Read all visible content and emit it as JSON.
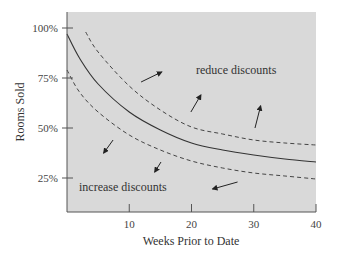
{
  "chart_data": {
    "type": "line",
    "title": "",
    "xlabel": "Weeks Prior to Date",
    "ylabel": "Rooms Sold",
    "xlim": [
      0,
      40
    ],
    "ylim": [
      8,
      108
    ],
    "grid": false,
    "legend": null,
    "x_ticks": [
      10,
      20,
      30,
      40
    ],
    "x_tick_labels": [
      "10",
      "20",
      "30",
      "40"
    ],
    "y_ticks": [
      25,
      50,
      75,
      100
    ],
    "y_tick_labels": [
      "25%",
      "50%",
      "75%",
      "100%"
    ],
    "series": [
      {
        "name": "expected booking curve",
        "style": "solid",
        "x": [
          0,
          2,
          5,
          10,
          15,
          20,
          25,
          30,
          35,
          40
        ],
        "values": [
          97,
          85,
          72,
          58,
          49,
          42.5,
          39,
          36.5,
          34.5,
          33
        ]
      },
      {
        "name": "upper threshold",
        "style": "dashed",
        "x": [
          3,
          5,
          10,
          15,
          20,
          25,
          30,
          35,
          40
        ],
        "values": [
          98,
          88,
          71,
          59,
          50.5,
          47,
          44,
          42.5,
          41.5
        ]
      },
      {
        "name": "lower threshold",
        "style": "dashed",
        "x": [
          0,
          2,
          5,
          10,
          15,
          20,
          25,
          30,
          35,
          40
        ],
        "values": [
          79,
          68,
          58,
          46.5,
          39,
          33.5,
          30,
          27.5,
          26,
          24.5
        ]
      }
    ],
    "annotations": [
      {
        "text": "reduce discounts",
        "x": 21,
        "y": 79
      },
      {
        "text": "increase discounts",
        "x": 2,
        "y": 20.5
      }
    ],
    "arrows": [
      {
        "from": [
          11.9,
          73
        ],
        "to": [
          15.2,
          78
        ],
        "region": "above"
      },
      {
        "from": [
          19.9,
          58
        ],
        "to": [
          21.5,
          66.5
        ],
        "region": "above"
      },
      {
        "from": [
          30.2,
          50
        ],
        "to": [
          31.1,
          61
        ],
        "region": "above"
      },
      {
        "from": [
          7.4,
          44
        ],
        "to": [
          5.9,
          37.5
        ],
        "region": "below"
      },
      {
        "from": [
          15.1,
          33
        ],
        "to": [
          14.1,
          28
        ],
        "region": "below"
      },
      {
        "from": [
          27.4,
          23
        ],
        "to": [
          23.4,
          19.5
        ],
        "region": "below"
      }
    ],
    "colors": {
      "plot_background": "#d9d9d9",
      "line": "#333333",
      "axis": "#555555"
    }
  }
}
